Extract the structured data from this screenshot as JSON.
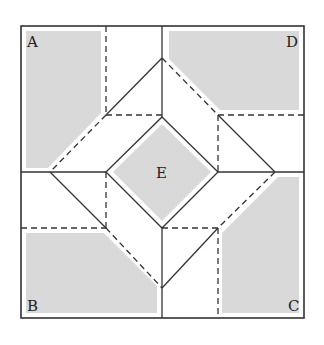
{
  "diagram": {
    "labels": {
      "A": "A",
      "B": "B",
      "C": "C",
      "D": "D",
      "E": "E"
    },
    "colors": {
      "shade": "#d9d9d9",
      "line": "#333333",
      "background": "#ffffff"
    }
  }
}
